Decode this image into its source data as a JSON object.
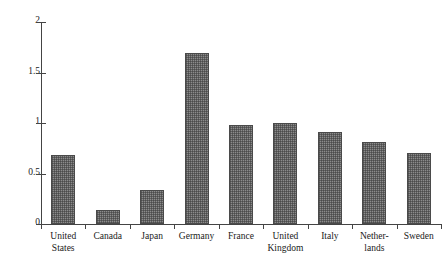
{
  "chart_data": {
    "type": "bar",
    "title": "",
    "subtitle": "",
    "xlabel": "",
    "ylabel": "",
    "categories": [
      "United States",
      "Canada",
      "Japan",
      "Germany",
      "France",
      "United Kingdom",
      "Italy",
      "Netherlands",
      "Sweden"
    ],
    "category_labels_wrapped": [
      "United\nStates",
      "Canada",
      "Japan",
      "Germany",
      "France",
      "United\nKingdom",
      "Italy",
      "Nether-\nlands",
      "Sweden"
    ],
    "values": [
      0.68,
      0.14,
      0.34,
      1.69,
      0.98,
      1.0,
      0.91,
      0.81,
      0.7
    ],
    "ylim": [
      0,
      2
    ],
    "ytick_values": [
      0,
      0.5,
      1,
      1.5,
      2
    ],
    "ytick_labels": [
      "0",
      "0.5",
      "1",
      "1.5",
      "2"
    ],
    "grid": false,
    "legend": null,
    "legend_position": "none",
    "bar_fill_color": "#8c8c8c",
    "bar_edge_color": "#4a4a4a",
    "axis_color": "#444444",
    "background_color": "#ffffff",
    "annotations": []
  }
}
